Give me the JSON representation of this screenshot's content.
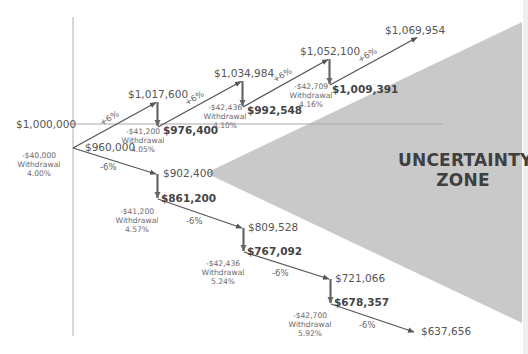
{
  "diagram": {
    "zone_label_line1": "UNCERTAINTY",
    "zone_label_line2": "ZONE",
    "baseline_label": "$1,000,000",
    "colors": {
      "zone_fill": "#c9c9c9",
      "path_line": "#555555",
      "axis_line": "#bbbbbb",
      "text": "#555555",
      "bold_text": "#444444"
    },
    "start_withdrawal": {
      "amount": "-$40,000",
      "label": "Withdrawal",
      "rate": "4.00%"
    },
    "start_balance": "$960,000",
    "up_path": {
      "steps": [
        {
          "change": "+6%",
          "peak": "$1,017,600",
          "withdrawal": "-$41,200",
          "withdrawal_label": "Withdrawal",
          "rate": "4.05%",
          "after": "$976,400"
        },
        {
          "change": "+6%",
          "peak": "$1,034,984",
          "withdrawal": "-$42,436",
          "withdrawal_label": "Withdrawal",
          "rate": "4.10%",
          "after": "$992,548"
        },
        {
          "change": "+6%",
          "peak": "$1,052,100",
          "withdrawal": "-$42,709",
          "withdrawal_label": "Withdrawal",
          "rate": "4.16%",
          "after": "$1,009,391"
        },
        {
          "change": "+6%",
          "peak": "$1,069,954"
        }
      ]
    },
    "down_path": {
      "steps": [
        {
          "change": "-6%",
          "trough": "$902,400",
          "withdrawal": "-$41,200",
          "withdrawal_label": "Withdrawal",
          "rate": "4.57%",
          "after": "$861,200"
        },
        {
          "change": "-6%",
          "trough": "$809,528",
          "withdrawal": "-$42,436",
          "withdrawal_label": "Withdrawal",
          "rate": "5.24%",
          "after": "$767,092"
        },
        {
          "change": "-6%",
          "trough": "$721,066",
          "withdrawal": "-$42,700",
          "withdrawal_label": "Withdrawal",
          "rate": "5.92%",
          "after": "$678,357"
        },
        {
          "change": "-6%",
          "trough": "$637,656"
        }
      ]
    }
  }
}
